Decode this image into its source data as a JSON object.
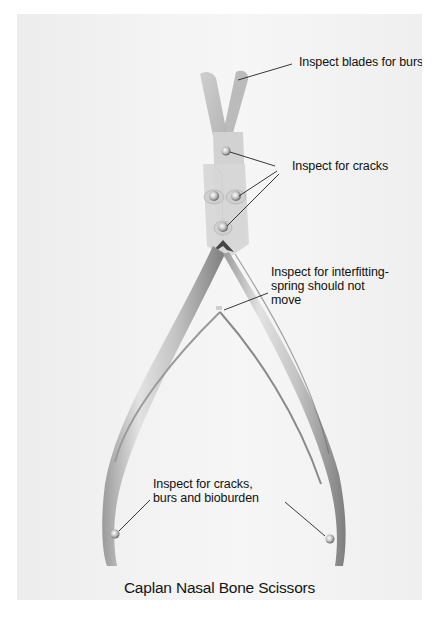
{
  "figure": {
    "title": "Caplan Nasal Bone Scissors",
    "callouts": [
      {
        "id": "blades",
        "text": "Inspect blades for burs"
      },
      {
        "id": "cracks",
        "text": "Inspect for cracks"
      },
      {
        "id": "interfitting",
        "lines": [
          "Inspect for interfitting-",
          "spring should not",
          "move"
        ]
      },
      {
        "id": "handles",
        "lines": [
          "Inspect for cracks,",
          "burs and bioburden"
        ]
      }
    ]
  },
  "colors": {
    "background": "#f2f2f2",
    "page": "#ffffff",
    "text": "#111111",
    "steel_light": "#e6e6e6",
    "steel_dark": "#8a8a8a"
  }
}
